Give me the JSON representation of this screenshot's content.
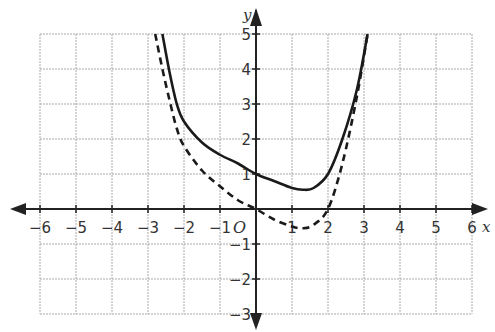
{
  "chart_data": {
    "type": "line",
    "title": "",
    "xlabel": "x",
    "ylabel": "y",
    "origin_label": "O",
    "xlim": [
      -6,
      6
    ],
    "ylim": [
      -3,
      5
    ],
    "grid": true,
    "x_ticks": [
      -6,
      -5,
      -4,
      -3,
      -2,
      -1,
      1,
      2,
      3,
      4,
      5,
      6
    ],
    "y_ticks": [
      5,
      4,
      3,
      2,
      1,
      -1,
      -2,
      -3
    ],
    "series": [
      {
        "name": "solid curve",
        "style": "solid",
        "x": [
          -2.6,
          -2.4,
          -2.2,
          -2.0,
          -1.5,
          -1.0,
          -0.5,
          0,
          0.5,
          1.0,
          1.3,
          1.6,
          2.0,
          2.4,
          2.8,
          3.1
        ],
        "y": [
          5.0,
          3.9,
          3.0,
          2.5,
          1.9,
          1.55,
          1.3,
          1.0,
          0.8,
          0.6,
          0.55,
          0.6,
          1.0,
          2.0,
          3.4,
          5.0
        ]
      },
      {
        "name": "dashed curve",
        "style": "dashed",
        "x": [
          -2.8,
          -2.6,
          -2.4,
          -2.2,
          -2.0,
          -1.5,
          -1.0,
          -0.5,
          0,
          0.5,
          1.0,
          1.3,
          1.6,
          2.0,
          2.4,
          2.8,
          3.1
        ],
        "y": [
          5.0,
          4.0,
          3.1,
          2.3,
          1.8,
          1.1,
          0.65,
          0.25,
          0.0,
          -0.3,
          -0.5,
          -0.55,
          -0.45,
          0.0,
          1.3,
          3.2,
          5.0
        ]
      }
    ]
  },
  "labels": {
    "x_axis": "x",
    "y_axis": "y",
    "origin": "O",
    "x_ticks": [
      "−6",
      "−5",
      "−4",
      "−3",
      "−2",
      "−1",
      "1",
      "2",
      "3",
      "4",
      "5",
      "6"
    ],
    "y_ticks": [
      "5",
      "4",
      "3",
      "2",
      "1",
      "−1",
      "−2",
      "−3"
    ]
  }
}
